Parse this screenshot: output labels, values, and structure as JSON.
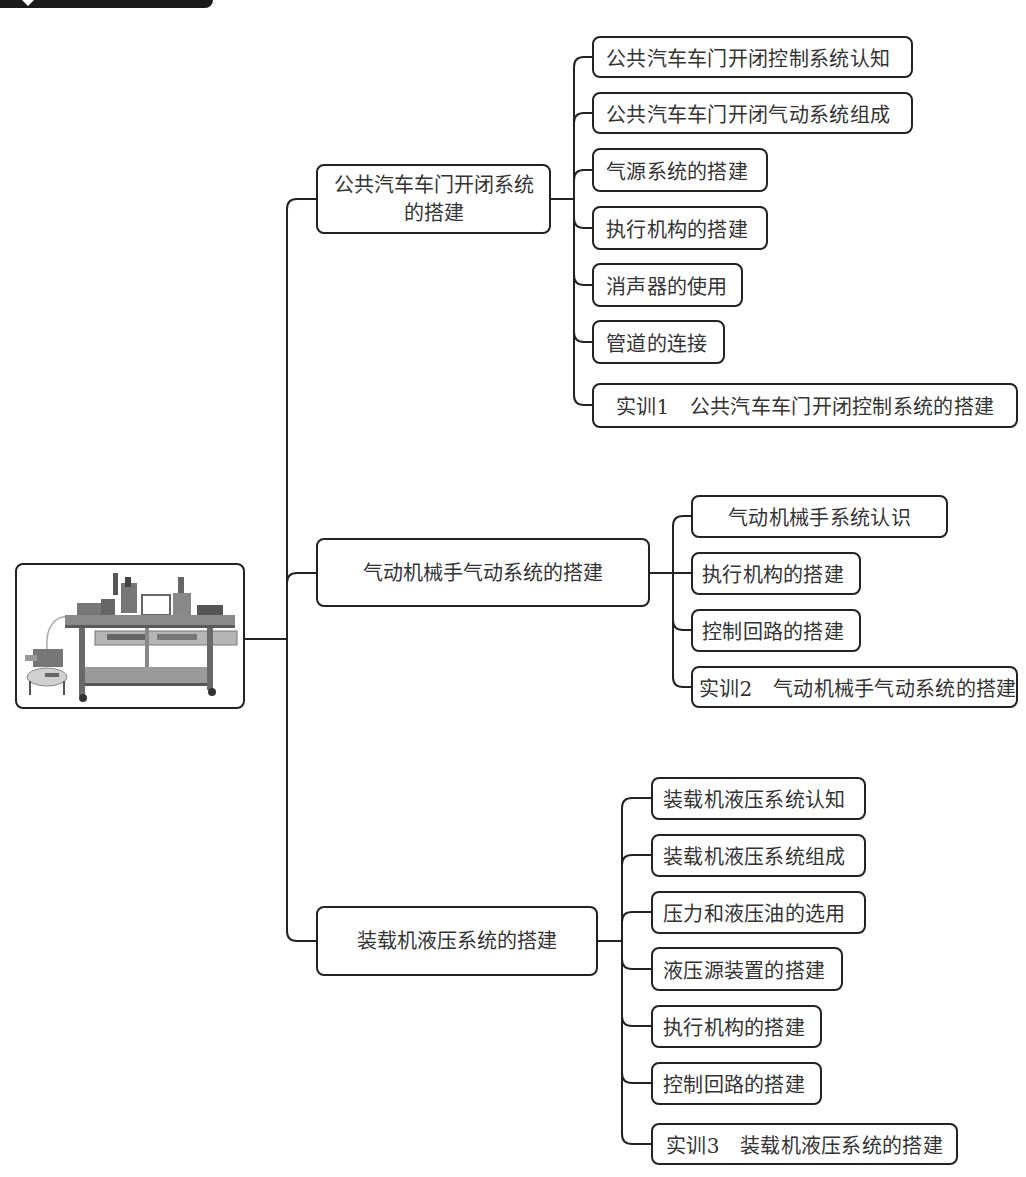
{
  "root": {
    "icon": "equipment-photo",
    "description_hidden": null
  },
  "branches": [
    {
      "label_lines": [
        "公共汽车车门开闭系统",
        "的搭建"
      ],
      "children": [
        "公共汽车车门开闭控制系统认知",
        "公共汽车车门开闭气动系统组成",
        "气源系统的搭建",
        "执行机构的搭建",
        "消声器的使用",
        "管道的连接",
        "实训1　公共汽车车门开闭控制系统的搭建"
      ]
    },
    {
      "label_lines": [
        "气动机械手气动系统的搭建"
      ],
      "children": [
        "气动机械手系统认识",
        "执行机构的搭建",
        "控制回路的搭建",
        "实训2　气动机械手气动系统的搭建"
      ]
    },
    {
      "label_lines": [
        "装载机液压系统的搭建"
      ],
      "children": [
        "装载机液压系统认知",
        "装载机液压系统组成",
        "压力和液压油的选用",
        "液压源装置的搭建",
        "执行机构的搭建",
        "控制回路的搭建",
        "实训3　装载机液压系统的搭建"
      ]
    }
  ],
  "colors": {
    "line": "#222222",
    "text": "#333333",
    "banner": "#1a1a1a"
  }
}
